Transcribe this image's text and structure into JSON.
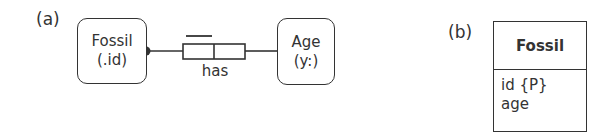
{
  "panel_a": {
    "label": "(a)",
    "entity_left": {
      "name": "Fossil",
      "ref_mode": "(.id)"
    },
    "entity_right": {
      "name": "Age",
      "ref_mode": "(y:)"
    },
    "fact_type": {
      "reading": "has",
      "roles": 2,
      "uniqueness_on_role": 1,
      "mandatory_on": "Fossil"
    }
  },
  "panel_b": {
    "label": "(b)",
    "class": {
      "name": "Fossil",
      "attributes": [
        "id {P}",
        "age"
      ]
    }
  },
  "colors": {
    "stroke": "#333333",
    "background": "#ffffff"
  }
}
